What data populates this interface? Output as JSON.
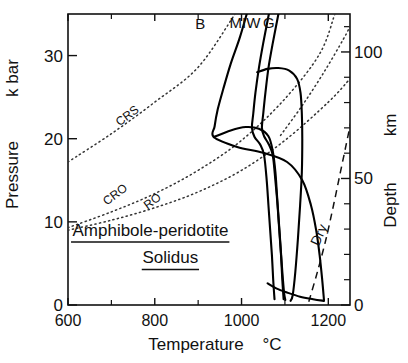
{
  "chart_data": {
    "type": "line",
    "title": "",
    "annotation_title_line1": "Amphibole-peridotite",
    "annotation_title_line2": "Solidus",
    "xlabel": "Temperature",
    "xunit": "°C",
    "ylabel": "Pressure",
    "yunit": "k bar",
    "y2label": "Depth",
    "y2unit": "km",
    "xlim": [
      600,
      1250
    ],
    "ylim": [
      0,
      35
    ],
    "y2lim": [
      0,
      115
    ],
    "grid": false,
    "legend": "inline-curve-labels",
    "xticks_major": [
      600,
      800,
      1000,
      1200
    ],
    "xticklabels": [
      "600",
      "800",
      "1000",
      "1200"
    ],
    "xticks_minor": [
      700,
      900,
      1100
    ],
    "yticks_major": [
      0,
      10,
      20,
      30
    ],
    "yticklabels": [
      "0",
      "10",
      "20",
      "30"
    ],
    "y2ticks_major": [
      0,
      50,
      100
    ],
    "y2ticklabels": [
      "0",
      "50",
      "100"
    ],
    "y2ticks_minor": [
      10,
      20,
      30,
      40,
      60,
      70,
      80,
      90,
      110
    ],
    "series": [
      {
        "name": "B",
        "label": "B",
        "style": "solid",
        "label_xy": [
          905,
          33.2
        ],
        "points": [
          [
            1012,
            35.0
          ],
          [
            995,
            32.0
          ],
          [
            975,
            29.0
          ],
          [
            958,
            26.0
          ],
          [
            945,
            23.5
          ],
          [
            938,
            21.5
          ],
          [
            936,
            20.2
          ],
          [
            990,
            19.0
          ],
          [
            1050,
            18.3
          ],
          [
            1105,
            17.2
          ],
          [
            1140,
            15.0
          ],
          [
            1160,
            12.0
          ],
          [
            1172,
            9.0
          ],
          [
            1180,
            6.0
          ],
          [
            1186,
            3.0
          ],
          [
            1190,
            0.6
          ]
        ]
      },
      {
        "name": "MIW",
        "label": "MIW",
        "style": "solid",
        "label_xy": [
          1008,
          33.3
        ],
        "points": [
          [
            1063,
            35.0
          ],
          [
            1050,
            31.5
          ],
          [
            1040,
            28.5
          ],
          [
            1032,
            25.5
          ],
          [
            1027,
            23.0
          ],
          [
            1024,
            21.3
          ],
          [
            1030,
            20.2
          ],
          [
            1043,
            19.3
          ],
          [
            1052,
            18.0
          ],
          [
            1058,
            15.0
          ],
          [
            1062,
            12.0
          ],
          [
            1066,
            9.0
          ],
          [
            1070,
            6.0
          ],
          [
            1073,
            3.0
          ],
          [
            1076,
            0.7
          ]
        ]
      },
      {
        "name": "G",
        "label": "G",
        "style": "solid",
        "label_xy": [
          1063,
          33.3
        ],
        "points": [
          [
            1085,
            35.0
          ],
          [
            1072,
            31.5
          ],
          [
            1062,
            28.5
          ],
          [
            1055,
            25.5
          ],
          [
            1050,
            23.0
          ],
          [
            1047,
            21.3
          ],
          [
            1052,
            20.3
          ],
          [
            1063,
            19.3
          ],
          [
            1072,
            18.0
          ],
          [
            1078,
            15.0
          ],
          [
            1083,
            12.0
          ],
          [
            1087,
            9.0
          ],
          [
            1091,
            6.0
          ],
          [
            1094,
            3.0
          ],
          [
            1097,
            0.7
          ]
        ]
      },
      {
        "name": "upper-plateau-curve",
        "label": "",
        "style": "solid",
        "points": [
          [
            1036,
            28.0
          ],
          [
            1060,
            28.4
          ],
          [
            1085,
            28.5
          ],
          [
            1110,
            28.2
          ],
          [
            1128,
            27.2
          ],
          [
            1136,
            25.5
          ],
          [
            1139,
            23.0
          ],
          [
            1140,
            20.0
          ],
          [
            1139,
            16.0
          ],
          [
            1135,
            12.0
          ],
          [
            1130,
            8.0
          ],
          [
            1124,
            4.0
          ],
          [
            1118,
            1.2
          ],
          [
            1113,
            0.5
          ]
        ]
      },
      {
        "name": "lower-sweep-curve",
        "label": "",
        "style": "solid",
        "points": [
          [
            936,
            20.2
          ],
          [
            975,
            21.0
          ],
          [
            1010,
            21.4
          ],
          [
            1040,
            21.2
          ],
          [
            1062,
            20.3
          ],
          [
            1072,
            18.5
          ],
          [
            1078,
            16.0
          ],
          [
            1082,
            13.0
          ],
          [
            1086,
            10.0
          ],
          [
            1090,
            7.0
          ],
          [
            1094,
            4.0
          ],
          [
            1098,
            1.5
          ],
          [
            1101,
            0.6
          ]
        ]
      },
      {
        "name": "basal-arc-curve",
        "label": "",
        "style": "solid",
        "points": [
          [
            1060,
            2.6
          ],
          [
            1080,
            2.0
          ],
          [
            1105,
            1.5
          ],
          [
            1135,
            1.0
          ],
          [
            1165,
            0.7
          ],
          [
            1190,
            0.5
          ]
        ]
      }
    ],
    "reaction_lines": [
      {
        "name": "CRS",
        "label": "CRS",
        "style": "dotted",
        "label_xy": [
          742,
          22.4
        ],
        "points": [
          [
            600,
            17.2
          ],
          [
            700,
            20.6
          ],
          [
            800,
            24.4
          ],
          [
            900,
            28.6
          ],
          [
            985,
            35.0
          ]
        ]
      },
      {
        "name": "CRO",
        "label": "CRO",
        "style": "dotted",
        "label_xy": [
          714,
          12.9
        ],
        "points": [
          [
            600,
            9.3
          ],
          [
            700,
            11.2
          ],
          [
            800,
            13.4
          ],
          [
            900,
            16.2
          ],
          [
            1000,
            19.8
          ],
          [
            1100,
            24.8
          ],
          [
            1180,
            30.2
          ],
          [
            1215,
            35.0
          ]
        ]
      },
      {
        "name": "RO",
        "label": "RO",
        "style": "dotted",
        "label_xy": [
          800,
          12.1
        ],
        "points": [
          [
            600,
            9.0
          ],
          [
            700,
            10.2
          ],
          [
            800,
            11.7
          ],
          [
            900,
            13.6
          ],
          [
            1000,
            16.2
          ],
          [
            1100,
            19.8
          ],
          [
            1200,
            24.4
          ],
          [
            1250,
            27.2
          ]
        ]
      },
      {
        "name": "upper-right-dotted",
        "label": "",
        "style": "dotted",
        "points": [
          [
            1090,
            20.4
          ],
          [
            1140,
            24.0
          ],
          [
            1190,
            28.0
          ],
          [
            1235,
            32.0
          ],
          [
            1250,
            33.5
          ]
        ]
      }
    ],
    "dry_solidus": {
      "name": "Dry",
      "label": "Dry",
      "style": "dashed",
      "label_xy": [
        1188,
        8.2
      ],
      "points": [
        [
          1155,
          0.4
        ],
        [
          1175,
          4.0
        ],
        [
          1195,
          8.0
        ],
        [
          1212,
          12.0
        ],
        [
          1228,
          16.0
        ],
        [
          1242,
          19.5
        ],
        [
          1252,
          22.0
        ]
      ]
    }
  }
}
